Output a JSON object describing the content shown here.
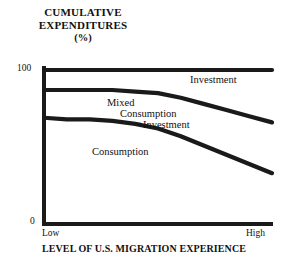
{
  "chart_data": {
    "type": "area",
    "title": "CUMULATIVE EXPENDITURES",
    "title_line1": "CUMULATIVE",
    "title_line2": "EXPENDITURES",
    "title_unit": "(%)",
    "ylabel": "CUMULATIVE EXPENDITURES (%)",
    "xlabel": "LEVEL OF U.S. MIGRATION EXPERIENCE",
    "ylim": [
      0,
      100
    ],
    "y_ticks": [
      "0",
      "100"
    ],
    "y_tick_top": "100",
    "y_tick_bottom": "0",
    "x_ticks": [
      "Low",
      "High"
    ],
    "x_tick_left": "Low",
    "x_tick_right": "High",
    "grid": false,
    "legend": "inline-band-labels",
    "line_color": "#1a1a1a",
    "axis_color": "#1a1a1a",
    "background": "#ffffff",
    "annotations": [
      {
        "text": "Investment",
        "band": "top"
      },
      {
        "text": "Mixed",
        "band": "middle"
      },
      {
        "text": "Consumption",
        "band": "middle"
      },
      {
        "text": "+Investment",
        "band": "middle"
      },
      {
        "text": "Consumption",
        "band": "bottom"
      }
    ],
    "x": [
      0,
      10,
      20,
      30,
      40,
      50,
      60,
      70,
      80,
      90,
      100
    ],
    "series": [
      {
        "name": "Investment",
        "description": "Top boundary, cumulative 100%",
        "values": [
          100,
          100,
          100,
          100,
          100,
          100,
          100,
          100,
          100,
          100,
          100
        ]
      },
      {
        "name": "Mixed Consumption +Investment",
        "description": "Upper interior boundary",
        "values": [
          87,
          87,
          87,
          87,
          86,
          85,
          82,
          78,
          74,
          70,
          66
        ]
      },
      {
        "name": "Consumption",
        "description": "Lower interior boundary",
        "values": [
          69,
          68,
          68,
          67,
          65,
          62,
          57,
          51,
          45,
          39,
          33
        ]
      }
    ]
  }
}
